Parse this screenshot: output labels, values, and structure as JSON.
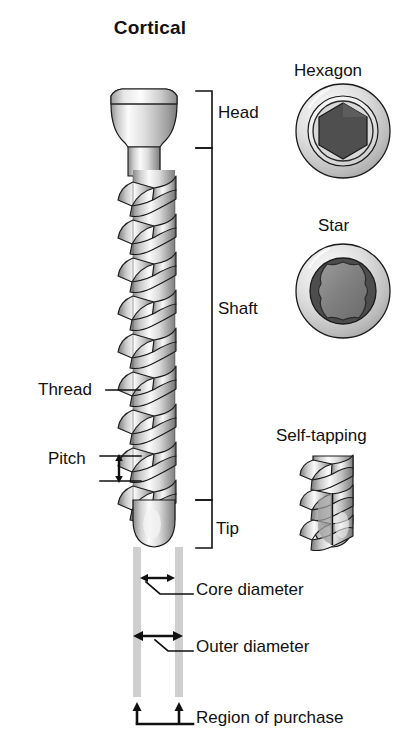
{
  "figure": {
    "title": "Cortical",
    "background": "#ffffff",
    "ink_color": "#111111",
    "metal_light": "#f2f2f2",
    "metal_mid": "#b9b9b9",
    "metal_dark": "#6e6e6e",
    "socket_dark": "#4a4a4a",
    "socket_mid": "#8a8a8a",
    "guide_gray": "#cfcfcf"
  },
  "main_screw": {
    "labels_right": [
      {
        "key": "head",
        "text": "Head"
      },
      {
        "key": "shaft",
        "text": "Shaft"
      },
      {
        "key": "tip",
        "text": "Tip"
      }
    ],
    "labels_left": [
      {
        "key": "thread",
        "text": "Thread"
      },
      {
        "key": "pitch",
        "text": "Pitch"
      }
    ],
    "labels_bottom": [
      {
        "key": "core_diameter",
        "text": "Core diameter"
      },
      {
        "key": "outer_diameter",
        "text": "Outer diameter"
      },
      {
        "key": "region_of_purchase",
        "text": "Region of purchase"
      }
    ]
  },
  "drive_types": [
    {
      "key": "hexagon",
      "text": "Hexagon",
      "socket": "hexagonal recess, 6 flat sides"
    },
    {
      "key": "star",
      "text": "Star",
      "socket": "six-lobed torx recess"
    }
  ],
  "tip_types": [
    {
      "key": "self_tapping",
      "text": "Self-tapping",
      "note": "fluted cutting tip"
    }
  ],
  "icons": {
    "pitch_arrow": "double-headed-vertical-arrow-icon",
    "core_arrow": "double-headed-horizontal-arrow-icon",
    "outer_arrow": "double-headed-horizontal-arrow-icon",
    "region_arrows": "two-up-arrows-icon"
  }
}
